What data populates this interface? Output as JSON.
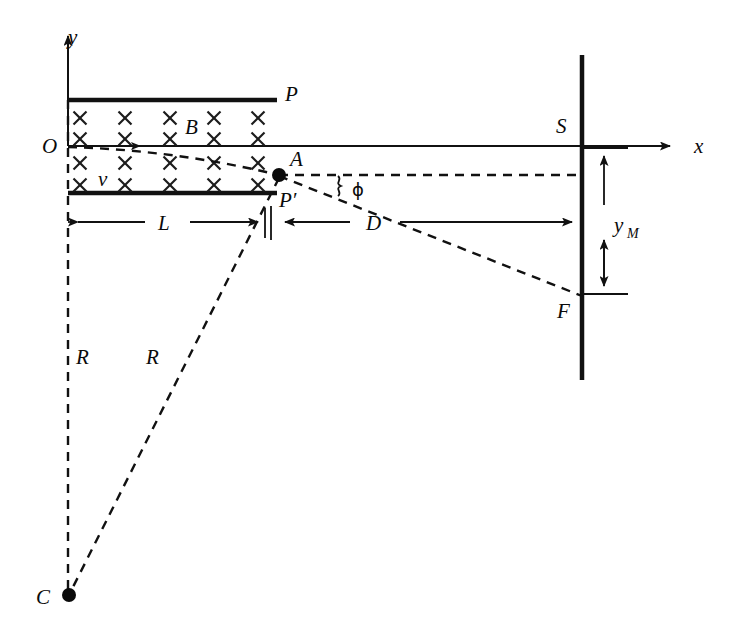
{
  "figure": {
    "width": 742,
    "height": 644,
    "background_color": "#ffffff",
    "ink_color": "#111111"
  },
  "labels": {
    "y_axis": "y",
    "x_axis": "x",
    "origin": "O",
    "plate_top": "P",
    "plate_bottom": "P′",
    "field": "B",
    "velocity": "v",
    "exit_point": "A",
    "screen": "S",
    "spot": "F",
    "length_L": "L",
    "distance_D": "D",
    "deflection": "y",
    "deflection_sub": "M",
    "radius_left": "R",
    "radius_right": "R",
    "center": "C",
    "angle": "ϕ"
  },
  "field_region": {
    "symbol": "×",
    "symbol_name": "into-page-field-cross",
    "columns_x": [
      80,
      125,
      170,
      214,
      258
    ],
    "rows_y": [
      118,
      139,
      163,
      185
    ],
    "cross_size": 13,
    "skip": [
      [
        3,
        0
      ]
    ]
  },
  "geometry": {
    "y_axis_x": 68,
    "x_axis_y": 146,
    "y_axis_top": 28,
    "x_axis_end": 678,
    "plate_top_y": 100,
    "plate_bottom_y": 193,
    "plate_left_x": 68,
    "plate_right_x": 277,
    "point_A": [
      279,
      175
    ],
    "point_C": [
      69,
      595
    ],
    "point_F": [
      582,
      296
    ],
    "screen_x": 582,
    "screen_top": 55,
    "screen_bottom": 380,
    "dim_line_y": 222,
    "tick_x": 270,
    "ym_arrow_x": 604,
    "ym_top": 148,
    "ym_bottom": 294
  }
}
